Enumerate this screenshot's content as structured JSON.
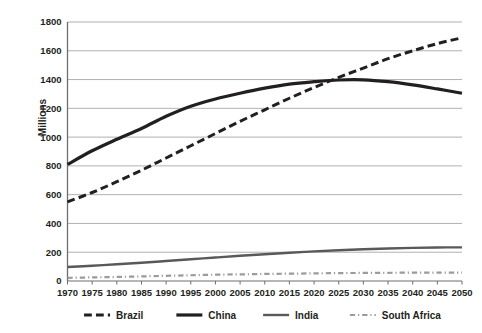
{
  "chart_data": {
    "type": "line",
    "title": "",
    "xlabel": "",
    "ylabel": "Millions",
    "ylim": [
      0,
      1800
    ],
    "ytick_step": 200,
    "xlim": [
      1970,
      2050
    ],
    "grid": true,
    "legend_position": "bottom",
    "categories": [
      1970,
      1975,
      1980,
      1985,
      1990,
      1995,
      2000,
      2005,
      2010,
      2015,
      2020,
      2025,
      2030,
      2035,
      2040,
      2045,
      2050
    ],
    "xticklabels": [
      "1970",
      "1975",
      "1980",
      "1985",
      "1990",
      "1995",
      "2000",
      "2005",
      "2010",
      "2015",
      "2020",
      "2025",
      "2030",
      "2035",
      "2040",
      "2045",
      "2050"
    ],
    "yticklabels": [
      "0",
      "200",
      "400",
      "600",
      "800",
      "1000",
      "1200",
      "1400",
      "1600",
      "1800"
    ],
    "series": [
      {
        "name": "Brazil",
        "style": "dashed",
        "color": "#231f20",
        "width": 3.0,
        "values": [
          550,
          615,
          690,
          770,
          855,
          940,
          1025,
          1110,
          1190,
          1270,
          1345,
          1415,
          1480,
          1545,
          1600,
          1650,
          1690
        ]
      },
      {
        "name": "China",
        "style": "solid",
        "color": "#231f20",
        "width": 3.2,
        "values": [
          810,
          905,
          985,
          1060,
          1145,
          1215,
          1265,
          1305,
          1340,
          1368,
          1385,
          1397,
          1398,
          1385,
          1363,
          1335,
          1305
        ]
      },
      {
        "name": "India",
        "style": "solid",
        "color": "#58595b",
        "width": 2.4,
        "values": [
          97,
          106,
          116,
          127,
          139,
          151,
          163,
          175,
          186,
          196,
          206,
          214,
          221,
          226,
          230,
          233,
          234
        ]
      },
      {
        "name": "South Africa",
        "style": "dashdot",
        "color": "#9b9b9b",
        "width": 2.2,
        "values": [
          22,
          25,
          28,
          32,
          36,
          40,
          44,
          46,
          49,
          51,
          53,
          55,
          56,
          57,
          58,
          58,
          58
        ]
      }
    ]
  },
  "legend": {
    "items": [
      {
        "label": "Brazil",
        "style": "dashed",
        "color": "#231f20"
      },
      {
        "label": "China",
        "style": "solid",
        "color": "#231f20"
      },
      {
        "label": "India",
        "style": "solid",
        "color": "#58595b"
      },
      {
        "label": "South Africa",
        "style": "dashdot",
        "color": "#9b9b9b"
      }
    ]
  },
  "axes": {
    "y_title": "Millions"
  },
  "colors": {
    "grid": "#9d9d9d",
    "axis": "#6d6e71",
    "text": "#231f20",
    "background": "#ffffff"
  }
}
